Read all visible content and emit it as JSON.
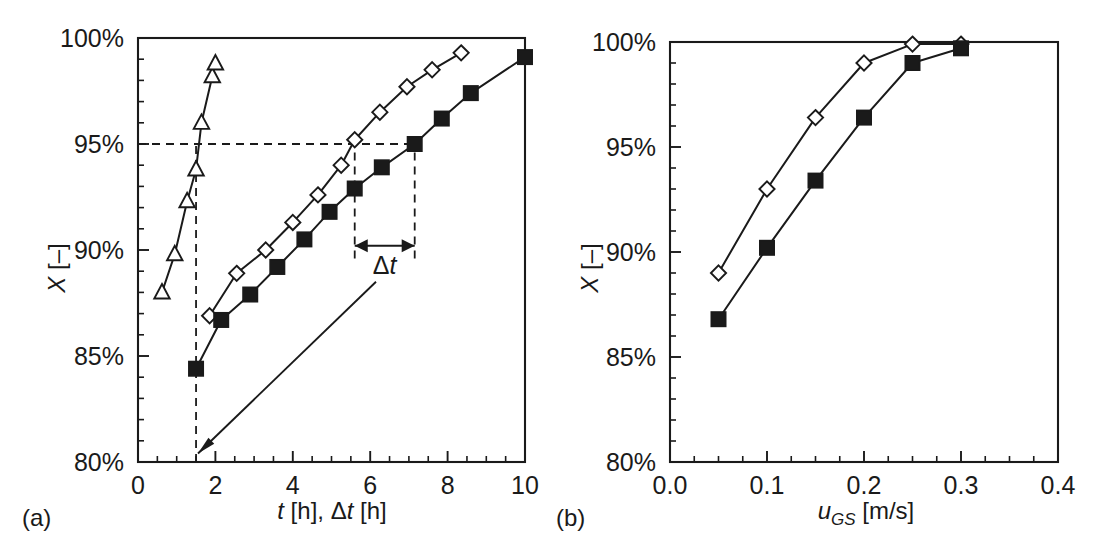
{
  "figure": {
    "background": "#ffffff",
    "ink_color": "#1a1a1a",
    "panel_a_label": "(a)",
    "panel_b_label": "(b)"
  },
  "chart_data": [
    {
      "type": "line",
      "panel": "a",
      "title": "",
      "xlabel": "t [h], Δt [h]",
      "ylabel": "X [–]",
      "xlim": [
        0,
        10
      ],
      "ylim": [
        80,
        100
      ],
      "xticks": [
        0,
        2,
        4,
        6,
        8,
        10
      ],
      "xticklabels": [
        "0",
        "2",
        "4",
        "6",
        "8",
        "10"
      ],
      "xtick_minor_step": 0.5,
      "yticks": [
        80,
        85,
        90,
        95,
        100
      ],
      "yticklabels": [
        "80%",
        "85%",
        "90%",
        "95%",
        "100%"
      ],
      "ytick_minor_step": 1,
      "grid": false,
      "legend": "none",
      "series": [
        {
          "name": "triangles",
          "marker": "open-triangle",
          "x": [
            0.62,
            0.95,
            1.27,
            1.5,
            1.64,
            1.92,
            2.0
          ],
          "y": [
            88.0,
            89.8,
            92.3,
            93.8,
            96.0,
            98.2,
            98.8
          ]
        },
        {
          "name": "open-diamonds",
          "marker": "open-diamond",
          "x": [
            1.85,
            2.55,
            3.3,
            4.0,
            4.65,
            5.25,
            5.6,
            6.25,
            6.95,
            7.6,
            8.35
          ],
          "y": [
            86.9,
            88.9,
            90.0,
            91.3,
            92.6,
            94.0,
            95.2,
            96.5,
            97.7,
            98.5,
            99.3
          ]
        },
        {
          "name": "filled-squares",
          "marker": "filled-square",
          "x": [
            1.5,
            2.15,
            2.9,
            3.6,
            4.3,
            4.95,
            5.6,
            6.3,
            7.15,
            7.85,
            8.6,
            10.0
          ],
          "y": [
            84.4,
            86.7,
            87.9,
            89.2,
            90.5,
            91.8,
            92.9,
            93.9,
            95.0,
            96.2,
            97.4,
            99.1
          ]
        }
      ],
      "annotations": [
        {
          "kind": "h-dashed",
          "y": 95,
          "x_from": 0,
          "x_to": 7.15,
          "label": "95% reference line"
        },
        {
          "kind": "v-dashed",
          "x": 1.5,
          "y_from": 80,
          "y_to": 95,
          "label": "t at 95% for triangles"
        },
        {
          "kind": "v-dashed",
          "x": 5.6,
          "y_from": 89.6,
          "y_to": 95,
          "label": "t at 95% for diamonds"
        },
        {
          "kind": "v-dashed",
          "x": 7.15,
          "y_from": 89.6,
          "y_to": 95,
          "label": "t at 95% for squares"
        },
        {
          "kind": "double-arrow",
          "x_from": 5.6,
          "x_to": 7.15,
          "y": 90.2,
          "text": "Δt"
        },
        {
          "kind": "arrow",
          "x_from": 6.15,
          "y_from": 88.5,
          "x_to": 1.55,
          "y_to": 80.4,
          "text": ""
        }
      ]
    },
    {
      "type": "line",
      "panel": "b",
      "title": "",
      "xlabel": "u_GS [m/s]",
      "ylabel": "X [–]",
      "xlim": [
        0.0,
        0.4
      ],
      "ylim": [
        80,
        100
      ],
      "xticks": [
        0.0,
        0.1,
        0.2,
        0.3,
        0.4
      ],
      "xticklabels": [
        "0.0",
        "0.1",
        "0.2",
        "0.3",
        "0.4"
      ],
      "xtick_minor_step": 0.025,
      "yticks": [
        80,
        85,
        90,
        95,
        100
      ],
      "yticklabels": [
        "80%",
        "85%",
        "90%",
        "95%",
        "100%"
      ],
      "ytick_minor_step": 1,
      "grid": false,
      "legend": "none",
      "series": [
        {
          "name": "open-diamonds",
          "marker": "open-diamond",
          "x": [
            0.05,
            0.1,
            0.15,
            0.2,
            0.25,
            0.3
          ],
          "y": [
            89.0,
            93.0,
            96.4,
            99.0,
            99.9,
            99.9
          ]
        },
        {
          "name": "filled-squares",
          "marker": "filled-square",
          "x": [
            0.05,
            0.1,
            0.15,
            0.2,
            0.25,
            0.3
          ],
          "y": [
            86.8,
            90.2,
            93.4,
            96.4,
            99.0,
            99.7
          ]
        }
      ],
      "annotations": []
    }
  ],
  "labels": {
    "y_axis_symbol": "X",
    "y_axis_unit": "[–]",
    "a_x_symbol_1": "t",
    "a_x_unit_1": "[h],",
    "a_x_symbol_2": "Δt",
    "a_x_unit_2": "[h]",
    "b_x_symbol": "u",
    "b_x_subscript": "GS",
    "b_x_unit": "[m/s]",
    "delta_t": "Δt"
  }
}
